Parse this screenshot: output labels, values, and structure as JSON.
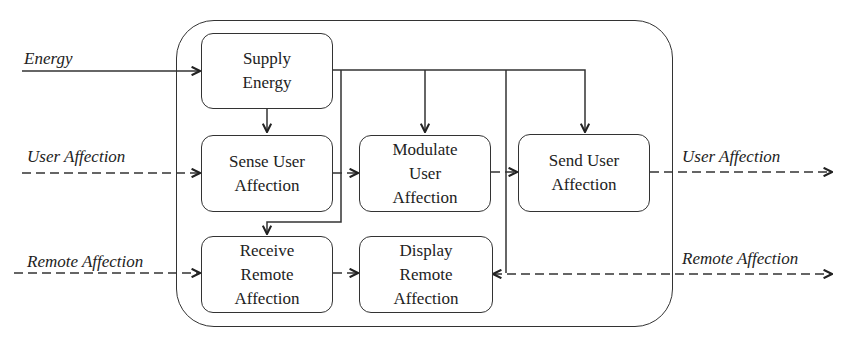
{
  "diagram": {
    "type": "functional-block-diagram",
    "inputs": {
      "energy": "Energy",
      "user_affection": "User Affection",
      "remote_affection": "Remote Affection"
    },
    "outputs": {
      "user_affection": "User Affection",
      "remote_affection": "Remote Affection"
    },
    "blocks": {
      "supply_energy": "Supply Energy",
      "sense_user_affection": "Sense User Affection",
      "modulate_user_affection": "Modulate User Affection",
      "send_user_affection": "Send User Affection",
      "receive_remote_affection": "Receive Remote Affection",
      "display_remote_affection": "Display Remote Affection"
    },
    "flows": [
      {
        "from": "Energy",
        "to": "Supply Energy",
        "style": "solid"
      },
      {
        "from": "Supply Energy",
        "to": "Sense User Affection",
        "style": "solid"
      },
      {
        "from": "Supply Energy",
        "to": "Modulate User Affection",
        "style": "solid"
      },
      {
        "from": "Supply Energy",
        "to": "Send User Affection",
        "style": "solid"
      },
      {
        "from": "Supply Energy",
        "to": "Receive Remote Affection",
        "style": "solid"
      },
      {
        "from": "Supply Energy",
        "to": "Display Remote Affection",
        "style": "solid"
      },
      {
        "from": "User Affection (in)",
        "to": "Sense User Affection",
        "style": "dashed"
      },
      {
        "from": "Sense User Affection",
        "to": "Modulate User Affection",
        "style": "dashed"
      },
      {
        "from": "Modulate User Affection",
        "to": "Send User Affection",
        "style": "dashed"
      },
      {
        "from": "Send User Affection",
        "to": "User Affection (out)",
        "style": "dashed"
      },
      {
        "from": "Remote Affection (in)",
        "to": "Receive Remote Affection",
        "style": "dashed"
      },
      {
        "from": "Receive Remote Affection",
        "to": "Display Remote Affection",
        "style": "dashed"
      },
      {
        "from": "Remote Affection (right)",
        "to": "Display Remote Affection",
        "style": "dashed"
      }
    ]
  }
}
